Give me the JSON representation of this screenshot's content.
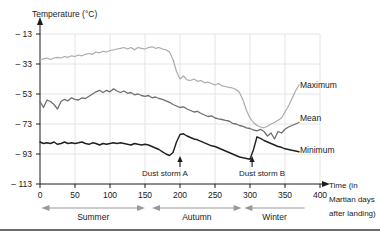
{
  "figure": {
    "y_axis_title": "Temperature (°C)",
    "x_axis_title_lines": [
      "Time (in",
      "Martian days",
      "after landing)"
    ]
  },
  "chart_data": {
    "type": "line",
    "xlabel": "Time (in Martian days after landing)",
    "ylabel": "Temperature (°C)",
    "xlim": [
      0,
      400
    ],
    "ylim": [
      -113,
      -13
    ],
    "grid": true,
    "x_ticks": [
      0,
      50,
      100,
      150,
      200,
      250,
      300,
      350,
      400
    ],
    "y_ticks": [
      -13,
      -33,
      -53,
      -73,
      -93,
      -113
    ],
    "y_tick_labels": [
      "– 13",
      "– 33",
      "– 53",
      "– 73",
      "– 93",
      "– 113"
    ],
    "legend_position": "right-of-lines",
    "x_step": 5,
    "colors": {
      "maximum": "#ababab",
      "mean": "#6f6f6f",
      "minimum": "#1f1f1f",
      "grid": "#e4e4e4",
      "axis": "#1a1a1a",
      "season_arrow": "#999999"
    },
    "series": [
      {
        "name": "Maximum",
        "color": "#ababab",
        "x_start": 0,
        "values": [
          -30,
          -29.5,
          -29,
          -30,
          -29,
          -28.5,
          -29,
          -28,
          -28.5,
          -27.5,
          -28,
          -27,
          -27.5,
          -26.5,
          -26,
          -26.5,
          -25,
          -25.5,
          -24.5,
          -25,
          -24,
          -23.5,
          -23,
          -22.5,
          -22,
          -23,
          -22,
          -23.5,
          -22,
          -22.5,
          -23,
          -22,
          -21.5,
          -22.5,
          -22,
          -23,
          -23.5,
          -25,
          -30,
          -38,
          -43,
          -41,
          -43.5,
          -44,
          -43,
          -44.5,
          -44,
          -45.5,
          -45,
          -46,
          -47,
          -46,
          -47.5,
          -48,
          -48.5,
          -49,
          -50,
          -52,
          -57,
          -64,
          -69,
          -72,
          -74,
          -75,
          -75.5,
          -74.5,
          -73,
          -72,
          -70.5,
          -69,
          -65,
          -61,
          -56,
          -51,
          -47
        ]
      },
      {
        "name": "Mean",
        "color": "#6f6f6f",
        "x_start": 0,
        "values": [
          -58,
          -62,
          -57,
          -58,
          -60,
          -63,
          -58,
          -56.5,
          -57.5,
          -55.5,
          -56.5,
          -57,
          -55.5,
          -56,
          -54.5,
          -53,
          -51.5,
          -50.5,
          -52,
          -50.5,
          -51.5,
          -49.5,
          -51,
          -52,
          -51,
          -52.5,
          -52,
          -53.5,
          -53,
          -54,
          -54.5,
          -54,
          -55.5,
          -55,
          -56,
          -56.5,
          -57.5,
          -58.5,
          -60,
          -61,
          -62,
          -61.5,
          -63,
          -64,
          -65,
          -64.5,
          -66,
          -67,
          -68,
          -67.5,
          -69,
          -69.5,
          -70,
          -70.5,
          -71,
          -72.5,
          -73,
          -74,
          -74.5,
          -75.5,
          -76,
          -77,
          -77.5,
          -76.5,
          -78,
          -81,
          -79,
          -83,
          -78,
          -79,
          -76.5,
          -75,
          -74,
          -73,
          -72
        ]
      },
      {
        "name": "Minimum",
        "color": "#1f1f1f",
        "x_start": 0,
        "values": [
          -85,
          -86,
          -85.5,
          -86,
          -85,
          -86.5,
          -86,
          -85,
          -86,
          -85.5,
          -86,
          -85.5,
          -85,
          -86,
          -86.5,
          -85.5,
          -86,
          -87,
          -86,
          -86.5,
          -86,
          -85.5,
          -86,
          -85.5,
          -86,
          -86.5,
          -87,
          -86,
          -86.5,
          -87,
          -86.5,
          -87,
          -88,
          -89,
          -90,
          -91.5,
          -93,
          -94,
          -92,
          -85,
          -80,
          -79.5,
          -81,
          -82,
          -83,
          -83.5,
          -84.5,
          -85.5,
          -86.5,
          -87.5,
          -88,
          -89,
          -90,
          -91,
          -92,
          -93,
          -94,
          -95,
          -95.5,
          -96,
          -96.5,
          -90,
          -81.5,
          -82.5,
          -84,
          -85,
          -86,
          -87,
          -88,
          -88.5,
          -89.5,
          -90,
          -90.5,
          -91,
          -91.5
        ]
      }
    ],
    "annotations": [
      {
        "label": "Dust storm A",
        "day": 200
      },
      {
        "label": "Dust storm B",
        "day": 303
      }
    ],
    "seasons": [
      {
        "label": "Summer",
        "start_day": 2,
        "end_day": 150,
        "arrow_left": true,
        "arrow_right": true
      },
      {
        "label": "Autumn",
        "start_day": 160,
        "end_day": 288,
        "arrow_left": true,
        "arrow_right": true
      },
      {
        "label": "Winter",
        "start_day": 292,
        "end_day": 378,
        "arrow_left": true,
        "arrow_right": false
      }
    ]
  }
}
